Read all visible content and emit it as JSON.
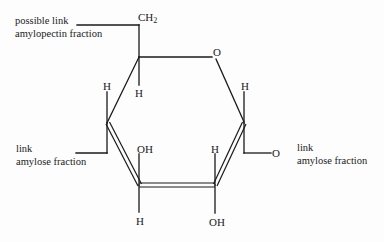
{
  "diagram": {
    "type": "haworth-projection",
    "colors": {
      "line": "#1a1a1a",
      "text": "#1a1a1a",
      "background": "#fdfdfd"
    },
    "labels": {
      "possible_link": "possible link",
      "amylopectin_fraction": "amylopectin fraction",
      "left_link": "link",
      "left_amylose_fraction": "amylose fraction",
      "right_link": "link",
      "right_amylose_fraction": "amylose fraction"
    },
    "atoms": {
      "ch2_main": "CH",
      "ch2_sub": "2",
      "ring_oxygen": "O",
      "c5_h": "H",
      "c4_h": "H",
      "c1_h": "H",
      "c3_oh": "OH",
      "c3_h": "H",
      "c2_h": "H",
      "c2_oh": "OH",
      "link_oxygen": "O"
    }
  }
}
